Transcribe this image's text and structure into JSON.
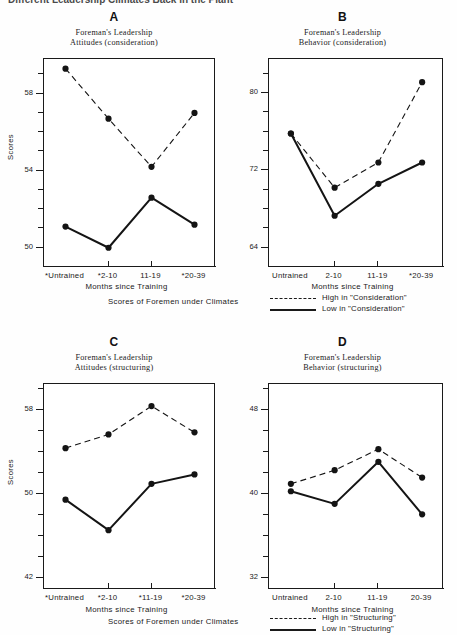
{
  "figure": {
    "top_caption_fragment": "Different  Leadership Climates  Back in the Plant",
    "climates_note": "Scores of Foremen under Climates",
    "x_axis_title": "Months since Training",
    "y_axis_title": "Scores"
  },
  "legends": {
    "consideration": {
      "high_label": "High in \"Consideration\"",
      "low_label": "Low in \"Consideration\"",
      "high_style": "dashed",
      "low_style": "solid"
    },
    "structuring": {
      "high_label": "High in \"Structuring\"",
      "low_label": "Low in \"Structuring\"",
      "high_style": "dashed",
      "low_style": "solid"
    }
  },
  "panels": [
    {
      "letter": "A",
      "title_line1": "Foreman's  Leadership",
      "title_line2": "Attitudes  (consideration)"
    },
    {
      "letter": "B",
      "title_line1": "Foreman's  Leadership",
      "title_line2": "Behavior  (consideration)"
    },
    {
      "letter": "C",
      "title_line1": "Foreman's  Leadership",
      "title_line2": "Attitudes  (structuring)"
    },
    {
      "letter": "D",
      "title_line1": "Foreman's  Leadership",
      "title_line2": "Behavior  (structuring)"
    }
  ],
  "chart_data": [
    {
      "id": "A",
      "type": "line",
      "title": "Foreman's Leadership Attitudes (consideration)",
      "xlabel": "Months since Training",
      "ylabel": "Scores",
      "categories": [
        "*Untrained",
        "*2-10",
        "11-19",
        "*20-39"
      ],
      "ylim": [
        49.0,
        59.8
      ],
      "yticks": [
        50,
        51,
        52,
        53,
        54,
        55,
        56,
        57,
        58,
        59
      ],
      "ytick_labels": {
        "50": "50",
        "54": "54",
        "58": "58"
      },
      "grid": false,
      "legend_position": "below-figure",
      "series": [
        {
          "name": "High in \"Consideration\"",
          "style": "dashed",
          "values": [
            59.3,
            56.7,
            54.2,
            57.0
          ]
        },
        {
          "name": "Low in \"Consideration\"",
          "style": "solid",
          "values": [
            51.1,
            50.0,
            52.6,
            51.2
          ]
        }
      ]
    },
    {
      "id": "B",
      "type": "line",
      "title": "Foreman's Leadership Behavior (consideration)",
      "xlabel": "Months since Training",
      "ylabel": "Scores",
      "categories": [
        "Untrained",
        "2-10",
        "11-19",
        "*20-39"
      ],
      "ylim": [
        62.0,
        83.5
      ],
      "yticks": [
        64,
        66,
        68,
        70,
        72,
        74,
        76,
        78,
        80,
        82
      ],
      "ytick_labels": {
        "64": "64",
        "72": "72",
        "80": "80"
      },
      "grid": false,
      "legend_position": "below-figure",
      "series": [
        {
          "name": "High in \"Consideration\"",
          "style": "dashed",
          "values": [
            75.8,
            70.2,
            72.8,
            81.1
          ]
        },
        {
          "name": "Low in \"Consideration\"",
          "style": "solid",
          "values": [
            75.8,
            67.3,
            70.6,
            72.8
          ]
        }
      ]
    },
    {
      "id": "C",
      "type": "line",
      "title": "Foreman's Leadership Attitudes (structuring)",
      "xlabel": "Months since Training",
      "ylabel": "Scores",
      "categories": [
        "*Untrained",
        "*2-10",
        "*11-19",
        "*20-39"
      ],
      "ylim": [
        41.0,
        60.5
      ],
      "yticks": [
        42,
        44,
        46,
        48,
        50,
        52,
        54,
        56,
        58,
        60
      ],
      "ytick_labels": {
        "42": "42",
        "50": "50",
        "58": "58"
      },
      "grid": false,
      "legend_position": "below-figure",
      "series": [
        {
          "name": "High in \"Structuring\"",
          "style": "dashed",
          "values": [
            54.4,
            55.7,
            58.4,
            55.9
          ]
        },
        {
          "name": "Low in \"Structuring\"",
          "style": "solid",
          "values": [
            49.5,
            46.6,
            51.0,
            51.9
          ]
        }
      ]
    },
    {
      "id": "D",
      "type": "line",
      "title": "Foreman's Leadership Behavior (structuring)",
      "xlabel": "Months since Training",
      "ylabel": "Scores",
      "categories": [
        "Untrained",
        "2-10",
        "11-19",
        "20-39"
      ],
      "ylim": [
        31.0,
        50.5
      ],
      "yticks": [
        32,
        34,
        36,
        38,
        40,
        42,
        44,
        46,
        48,
        50
      ],
      "ytick_labels": {
        "32": "32",
        "40": "40",
        "48": "48"
      },
      "grid": false,
      "legend_position": "below-figure",
      "series": [
        {
          "name": "High in \"Structuring\"",
          "style": "dashed",
          "values": [
            41.0,
            42.3,
            44.3,
            41.6
          ]
        },
        {
          "name": "Low in \"Structuring\"",
          "style": "solid",
          "values": [
            40.3,
            39.1,
            43.1,
            38.1
          ]
        }
      ]
    }
  ]
}
